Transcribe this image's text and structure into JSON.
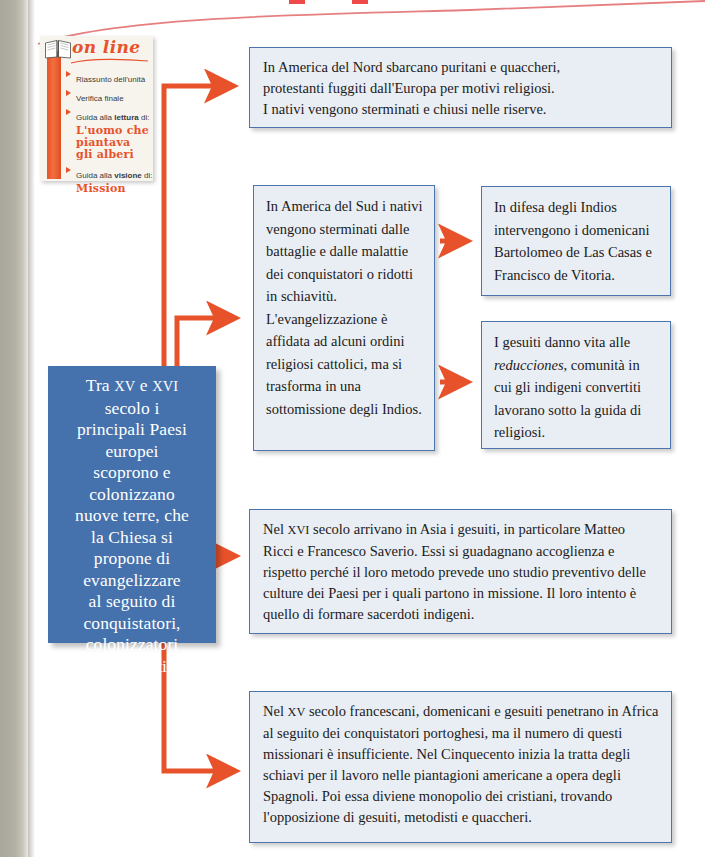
{
  "colors": {
    "accent_orange": "#e8522a",
    "node_blue": "#4571ac",
    "box_border_blue": "#4e74ac",
    "box_fill": "#e9eef4",
    "page_edge_gray": "#b3b1a4"
  },
  "online_panel": {
    "title": "on line",
    "icon": "open-book-icon",
    "items": [
      {
        "text": "Riassunto dell'unità",
        "bold_part": ""
      },
      {
        "text": "Verifica finale",
        "bold_part": ""
      },
      {
        "prefix": "Guida alla ",
        "bold_part": "lettura",
        "suffix": " di:"
      },
      {
        "prefix": "Guida alla ",
        "bold_part": "visione",
        "suffix": " di:"
      }
    ],
    "sub_titles": [
      "L'uomo che\npiantava\ngli alberi",
      "Mission"
    ],
    "item1": "Riassunto dell'unità",
    "item2": "Verifica finale",
    "item3_prefix": "Guida alla ",
    "item3_bold": "lettura",
    "item3_suffix": " di:",
    "item3_sub_l1": "L'uomo che",
    "item3_sub_l2": "piantava",
    "item3_sub_l3": "gli alberi",
    "item4_prefix": "Guida alla ",
    "item4_bold": "visione",
    "item4_suffix": " di:",
    "item4_sub": "Mission"
  },
  "diagram": {
    "type": "flowchart",
    "root": {
      "id": "node-main",
      "line1": "Tra ",
      "smallcaps1": "xv",
      "line1b": " e ",
      "smallcaps2": "xvi",
      "rest": "\nsecolo i\nprincipali Paesi\neuropei\nscoprono e\ncolonizzano\nnuove terre, che\nla Chiesa si\npropone di\nevangelizzare\nal seguito di\nconquistatori,\ncolonizzatori\ne mercanti.",
      "full_text": "Tra XV e XVI secolo i principali Paesi europei scoprono e colonizzano nuove terre, che la Chiesa si propone di evangelizzare al seguito di conquistatori, colonizzatori e mercanti."
    },
    "boxes": {
      "north": {
        "id": "box-north",
        "text": "In America del Nord sbarcano puritani e quaccheri, protestanti fuggiti dall'Europa per motivi religiosi. I nativi vengono sterminati e chiusi nelle riserve.",
        "l1": "In America del Nord sbarcano puritani e quaccheri,",
        "l2": "protestanti fuggiti dall'Europa per motivi religiosi.",
        "l3": "I nativi vengono sterminati e chiusi nelle riserve."
      },
      "south": {
        "id": "box-south",
        "text": "In America del Sud i nativi vengono sterminati dalle battaglie e dalle malattie dei conquistatori o ridotti in schiavitù. L'evangelizzazione è affidata ad alcuni ordini religiosi cattolici, ma si trasforma in una sottomissione degli Indios."
      },
      "defesa": {
        "id": "box-defesa",
        "text": "In difesa degli Indios intervengono i domenicani Bartolomeo de Las Casas e Francisco de Vitoria."
      },
      "gesuiti": {
        "id": "box-gesuiti",
        "pre": "I gesuiti danno vita alle ",
        "italic": "reducciones",
        "post": ", comunità in cui gli indigeni convertiti lavorano sotto la guida di religiosi.",
        "text": "I gesuiti danno vita alle reducciones, comunità in cui gli indigeni convertiti lavorano sotto la guida di religiosi."
      },
      "asia": {
        "id": "box-asia",
        "pre": "Nel ",
        "smallcaps": "xvi",
        "post": " secolo arrivano in Asia i gesuiti, in particolare Matteo Ricci e Francesco Saverio. Essi si guadagnano accoglienza e rispetto perché il loro metodo prevede uno studio preventivo delle culture dei Paesi per i quali partono in missione. Il loro intento è quello di formare sacerdoti indigeni.",
        "text": "Nel XVI secolo arrivano in Asia i gesuiti, in particolare Matteo Ricci e Francesco Saverio. Essi si guadagnano accoglienza e rispetto perché il loro metodo prevede uno studio preventivo delle culture dei Paesi per i quali partono in missione. Il loro intento è quello di formare sacerdoti indigeni."
      },
      "africa": {
        "id": "box-africa",
        "pre": "Nel ",
        "smallcaps": "xv",
        "post": " secolo francescani, domenicani e gesuiti penetrano in Africa al seguito dei conquistatori portoghesi, ma il numero di questi missionari è insufficiente. Nel Cinquecento inizia la tratta degli schiavi per il lavoro nelle piantagioni americane a opera degli Spagnoli. Poi essa diviene monopolio dei cristiani, trovando l'opposizione di gesuiti, metodisti e quaccheri.",
        "text": "Nel XV secolo francescani, domenicani e gesuiti penetrano in Africa al seguito dei conquistatori portoghesi, ma il numero di questi missionari è insufficiente. Nel Cinquecento inizia la tratta degli schiavi per il lavoro nelle piantagioni americane a opera degli Spagnoli. Poi essa diviene monopolio dei cristiani, trovando l'opposizione di gesuiti, metodisti e quaccheri."
      }
    },
    "edges": [
      {
        "from": "node-main",
        "to": "box-north"
      },
      {
        "from": "node-main",
        "to": "box-south"
      },
      {
        "from": "box-south",
        "to": "box-defesa"
      },
      {
        "from": "box-south",
        "to": "box-gesuiti"
      },
      {
        "from": "node-main",
        "to": "box-asia"
      },
      {
        "from": "node-main",
        "to": "box-africa"
      }
    ]
  }
}
